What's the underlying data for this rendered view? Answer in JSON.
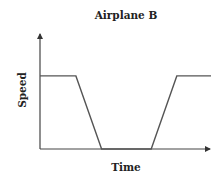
{
  "chart_data": {
    "type": "line",
    "title": "Airplane B",
    "xlabel": "Time",
    "ylabel": "Speed",
    "grid": false,
    "legend": null,
    "ticks": false,
    "x": [
      0,
      0.21,
      0.36,
      0.65,
      0.8,
      1.0
    ],
    "series": [
      {
        "name": "Airplane B speed",
        "values": [
          0.63,
          0.63,
          0,
          0,
          0.63,
          0.63
        ]
      }
    ],
    "xlim": [
      0,
      1
    ],
    "ylim": [
      0,
      1
    ]
  },
  "colors": {
    "line": "#555555",
    "axis": "#444444",
    "text": "#222222"
  }
}
